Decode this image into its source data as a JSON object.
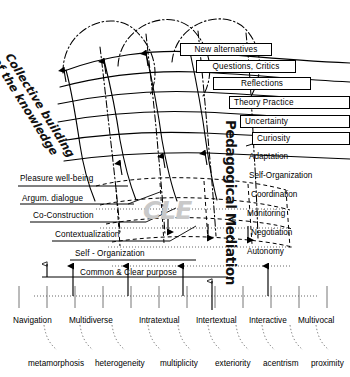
{
  "figure": {
    "vertical_title": "Pedagogical Mediation",
    "diagonal_title_line1": "Collective building",
    "diagonal_title_line2": "of the knowledge",
    "watermark": "CLE",
    "ink_color": "#000000",
    "background_color": "#ffffff",
    "watermark_color": "#c9c9c9"
  },
  "chart_data": {
    "type": "diagram",
    "staircase_steps": [
      "New alternatives",
      "Questions, Critics",
      "Reflections",
      "Theory  Practice",
      "Uncertainty",
      "Curiosity"
    ],
    "mediation_labels": [
      "Adaptation",
      "Self-Organization",
      "Coordination",
      "Monitoring",
      "Negotiation",
      "Autonomy"
    ],
    "ladder_rungs": [
      "Pleasure well-being",
      "Argum. dialogue",
      "Co-Construction",
      "Contextualization",
      "Self - Organization",
      "Common  &  Clear purpose"
    ],
    "axis_categories": [
      "Navigation",
      "Multidiverse",
      "Intratextual",
      "Intertextual",
      "Interactive",
      "Multivocal"
    ],
    "axis_subcategories": [
      "metamorphosis",
      "heterogeneity",
      "multiplicity",
      "exteriority",
      "acentrism",
      "proximity"
    ]
  },
  "steps": [
    {
      "label": "New alternatives",
      "x": 180,
      "y": 43,
      "w": 92
    },
    {
      "label": "Questions, Critics",
      "x": 196,
      "y": 60,
      "w": 100
    },
    {
      "label": "Reflections",
      "x": 213,
      "y": 77,
      "w": 98
    },
    {
      "label": "Theory  Practice",
      "x": 229,
      "y": 96,
      "w": 121
    },
    {
      "label": "Uncertainty",
      "x": 240,
      "y": 115,
      "w": 110
    },
    {
      "label": "Curiosity",
      "x": 252,
      "y": 132,
      "w": 98
    }
  ],
  "mediation": [
    {
      "label": "Adaptation",
      "x": 249,
      "y": 152
    },
    {
      "label": "Self-Organization",
      "x": 249,
      "y": 171
    },
    {
      "label": "Coordination",
      "x": 251,
      "y": 190
    },
    {
      "label": "Monitoring",
      "x": 247,
      "y": 209
    },
    {
      "label": "Negotiation",
      "x": 251,
      "y": 228
    },
    {
      "label": "Autonomy",
      "x": 247,
      "y": 247
    }
  ],
  "rungs": [
    {
      "label": "Pleasure well-being",
      "x": 20,
      "y": 174,
      "rx": 18,
      "rw": 0,
      "ry": 0,
      "dotted": false
    },
    {
      "label": "Argum. dialogue",
      "x": 22,
      "y": 194,
      "rx": 18,
      "rw": 0,
      "ry": 0,
      "dotted": false
    },
    {
      "label": "Co-Construction",
      "x": 33,
      "y": 211,
      "rx": 30,
      "rw": 120,
      "ry": 209,
      "dotted": false
    },
    {
      "label": "Contextualization",
      "x": 55,
      "y": 230,
      "rx": 50,
      "rw": 124,
      "ry": 228,
      "dotted": false
    },
    {
      "label": "Self - Organization",
      "x": 75,
      "y": 249,
      "rx": 68,
      "rw": 150,
      "ry": 247,
      "dotted": false
    },
    {
      "label": "Common  &  Clear purpose",
      "x": 80,
      "y": 268,
      "rx": 62,
      "rw": 170,
      "ry": 266,
      "dotted": false
    }
  ],
  "axis_labels": [
    {
      "label": "Navigation",
      "x": 13,
      "y": 316
    },
    {
      "label": "Multidiverse",
      "x": 69,
      "y": 316
    },
    {
      "label": "Intratextual",
      "x": 139,
      "y": 316
    },
    {
      "label": "Intertextual",
      "x": 196,
      "y": 316
    },
    {
      "label": "Interactive",
      "x": 249,
      "y": 316
    },
    {
      "label": "Multivocal",
      "x": 298,
      "y": 316
    }
  ],
  "sub_labels": [
    {
      "label": "metamorphosis",
      "x": 28,
      "y": 359
    },
    {
      "label": "heterogeneity",
      "x": 95,
      "y": 359
    },
    {
      "label": "multiplicity",
      "x": 160,
      "y": 359
    },
    {
      "label": "exteriority",
      "x": 215,
      "y": 359
    },
    {
      "label": "acentrism",
      "x": 263,
      "y": 359
    },
    {
      "label": "proximity",
      "x": 311,
      "y": 359
    }
  ]
}
